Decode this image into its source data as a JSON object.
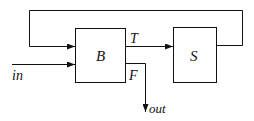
{
  "diagram": {
    "type": "block-diagram",
    "blocks": [
      {
        "id": "B",
        "label": "B"
      },
      {
        "id": "S",
        "label": "S"
      }
    ],
    "edges": [
      {
        "from": "in",
        "to": "B",
        "label": "in"
      },
      {
        "from": "B",
        "to": "S",
        "label": "T"
      },
      {
        "from": "B",
        "to": "out",
        "label": "F"
      },
      {
        "from": "S",
        "to": "B",
        "label": ""
      }
    ],
    "labels": {
      "in": "in",
      "T": "T",
      "F": "F",
      "out": "out",
      "B": "B",
      "S": "S"
    },
    "colors": {
      "stroke": "#111111",
      "background": "#ffffff"
    }
  }
}
